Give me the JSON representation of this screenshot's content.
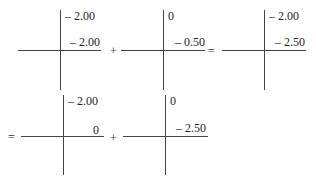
{
  "diagram": {
    "title": "",
    "row1": {
      "cross1": {
        "top": "– 2.00",
        "right": "– 2.00"
      },
      "op1": "+",
      "cross2": {
        "top": "0",
        "right": "– 0.50"
      },
      "op2": "=",
      "cross3": {
        "top": "– 2.00",
        "right": "– 2.50"
      }
    },
    "row2": {
      "op0": "=",
      "cross4": {
        "top": "– 2.00",
        "right": "0"
      },
      "op1": "+",
      "cross5": {
        "top": "0",
        "right": "– 2.50"
      }
    }
  }
}
